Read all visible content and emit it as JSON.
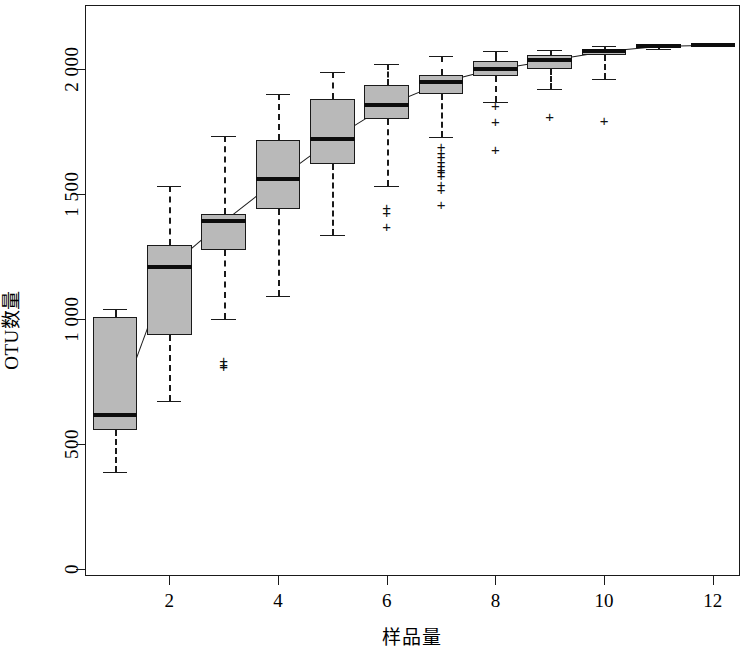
{
  "chart_data": {
    "type": "box",
    "title": "",
    "xlabel": "样品量",
    "ylabel": "OTU数量",
    "xlim": [
      0.45,
      12.5
    ],
    "ylim": [
      -30,
      2255
    ],
    "grid": false,
    "legend": "none",
    "x_ticks": [
      2,
      4,
      6,
      8,
      10,
      12
    ],
    "x_tick_labels": [
      "2",
      "4",
      "6",
      "8",
      "10",
      "12"
    ],
    "y_ticks": [
      0,
      500,
      1000,
      1500,
      2000
    ],
    "y_tick_labels": [
      "0",
      "500",
      "1 000",
      "1 500",
      "2 000"
    ],
    "box_fill": "#b9b9b9",
    "box_edge": "#1a1a1a",
    "categories": [
      1,
      2,
      3,
      4,
      5,
      6,
      7,
      8,
      9,
      10,
      11,
      12
    ],
    "boxes": [
      {
        "x": 1,
        "whisker_low": 385,
        "q1": 555,
        "median": 615,
        "q3": 1005,
        "whisker_high": 1040,
        "outliers": []
      },
      {
        "x": 2,
        "whisker_low": 670,
        "q1": 935,
        "median": 1205,
        "q3": 1295,
        "whisker_high": 1530,
        "outliers": []
      },
      {
        "x": 3,
        "whisker_low": 1000,
        "q1": 1275,
        "median": 1390,
        "q3": 1420,
        "whisker_high": 1730,
        "outliers": [
          835,
          820,
          810
        ]
      },
      {
        "x": 4,
        "whisker_low": 1090,
        "q1": 1440,
        "median": 1560,
        "q3": 1715,
        "whisker_high": 1900,
        "outliers": []
      },
      {
        "x": 5,
        "whisker_low": 1335,
        "q1": 1620,
        "median": 1720,
        "q3": 1880,
        "whisker_high": 1985,
        "outliers": []
      },
      {
        "x": 6,
        "whisker_low": 1530,
        "q1": 1800,
        "median": 1855,
        "q3": 1935,
        "whisker_high": 2020,
        "outliers": [
          1445,
          1425,
          1370
        ]
      },
      {
        "x": 7,
        "whisker_low": 1725,
        "q1": 1900,
        "median": 1945,
        "q3": 1975,
        "whisker_high": 2050,
        "outliers": [
          1690,
          1665,
          1650,
          1630,
          1615,
          1600,
          1590,
          1575,
          1540,
          1520,
          1460
        ]
      },
      {
        "x": 8,
        "whisker_low": 1865,
        "q1": 1970,
        "median": 2000,
        "q3": 2030,
        "whisker_high": 2070,
        "outliers": [
          1855,
          1790,
          1680
        ]
      },
      {
        "x": 9,
        "whisker_low": 1920,
        "q1": 2000,
        "median": 2035,
        "q3": 2055,
        "whisker_high": 2075,
        "outliers": [
          1810
        ]
      },
      {
        "x": 10,
        "whisker_low": 1960,
        "q1": 2055,
        "median": 2070,
        "q3": 2080,
        "whisker_high": 2090,
        "outliers": [
          1795
        ]
      },
      {
        "x": 11,
        "whisker_low": 2080,
        "q1": 2085,
        "median": 2090,
        "q3": 2092,
        "whisker_high": 2095,
        "outliers": []
      },
      {
        "x": 12,
        "whisker_low": 2095,
        "q1": 2095,
        "median": 2095,
        "q3": 2095,
        "whisker_high": 2095,
        "outliers": []
      }
    ]
  }
}
